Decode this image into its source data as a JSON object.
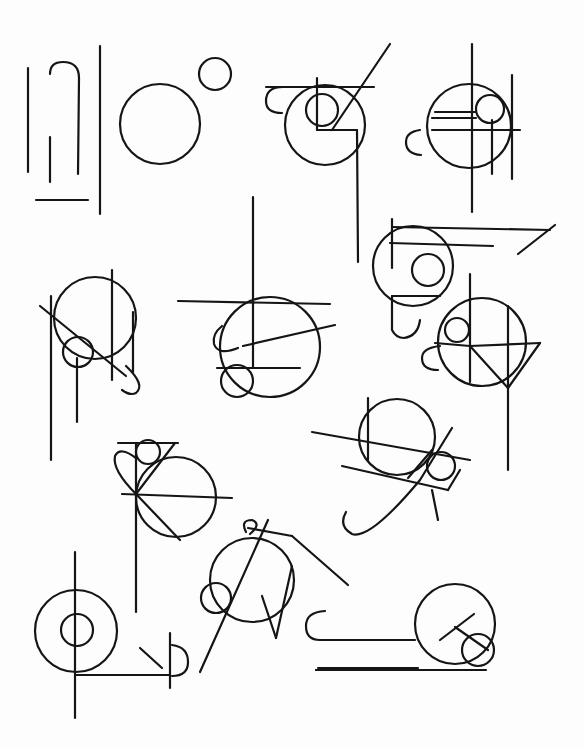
{
  "ink_color": "#151515",
  "paper_color": "#fdfdfd",
  "glyphs": [
    {
      "id": "g1",
      "lines": [
        [
          28,
          68,
          28,
          172
        ],
        [
          50,
          137,
          50,
          182
        ],
        [
          36,
          200,
          88,
          200
        ],
        [
          100,
          46,
          100,
          214
        ]
      ],
      "paths": [
        "M50,74 Q50,62 63,62 Q79,62 79,78 L78,174"
      ],
      "circles": []
    },
    {
      "id": "g2",
      "lines": [],
      "paths": [],
      "circles": [
        [
          160,
          124,
          40
        ],
        [
          215,
          74,
          16
        ]
      ]
    },
    {
      "id": "g3",
      "lines": [
        [
          266,
          87,
          374,
          87
        ],
        [
          317,
          78,
          317,
          130
        ],
        [
          317,
          130,
          357,
          130
        ],
        [
          332,
          130,
          390,
          44
        ],
        [
          357,
          130,
          358,
          262
        ]
      ],
      "paths": [
        "M283,87 Q266,87 266,101 Q266,113 282,113"
      ],
      "circles": [
        [
          325,
          125,
          40
        ],
        [
          322,
          110,
          16
        ]
      ]
    },
    {
      "id": "g4",
      "lines": [
        [
          472,
          44,
          472,
          212
        ],
        [
          432,
          118,
          476,
          118
        ],
        [
          435,
          112,
          476,
          112
        ],
        [
          432,
          130,
          520,
          130
        ],
        [
          492,
          120,
          492,
          174
        ],
        [
          512,
          75,
          512,
          179
        ]
      ],
      "paths": [
        "M420,130 Q406,132 406,142 Q406,154 421,155"
      ],
      "circles": [
        [
          469,
          126,
          42
        ],
        [
          490,
          109,
          14
        ]
      ]
    },
    {
      "id": "g5",
      "lines": [
        [
          392,
          219,
          392,
          268
        ],
        [
          392,
          227,
          550,
          230
        ],
        [
          390,
          243,
          493,
          246
        ],
        [
          392,
          296,
          440,
          296
        ],
        [
          518,
          254,
          555,
          225
        ]
      ],
      "paths": [
        "M392,296 L392,330 Q396,338 404,338 Q418,336 420,320"
      ],
      "circles": [
        [
          413,
          266,
          40
        ],
        [
          428,
          270,
          16
        ]
      ]
    },
    {
      "id": "g6",
      "lines": [
        [
          470,
          274,
          470,
          382
        ],
        [
          470,
          346,
          540,
          343
        ],
        [
          470,
          346,
          508,
          388
        ],
        [
          508,
          388,
          540,
          343
        ],
        [
          508,
          306,
          508,
          470
        ],
        [
          435,
          343,
          470,
          346
        ]
      ],
      "paths": [
        "M440,346 Q422,348 422,358 Q422,370 438,370"
      ],
      "circles": [
        [
          482,
          342,
          44
        ],
        [
          457,
          330,
          12
        ]
      ]
    },
    {
      "id": "g7",
      "lines": [
        [
          51,
          296,
          51,
          460
        ],
        [
          40,
          306,
          126,
          376
        ],
        [
          112,
          270,
          112,
          380
        ],
        [
          133,
          312,
          133,
          372
        ],
        [
          77,
          358,
          77,
          422
        ]
      ],
      "paths": [
        "M126,366 Q146,385 136,393 Q130,396 122,390"
      ],
      "circles": [
        [
          95,
          318,
          41
        ],
        [
          78,
          352,
          15
        ]
      ]
    },
    {
      "id": "g8",
      "lines": [
        [
          178,
          301,
          330,
          304
        ],
        [
          253,
          197,
          253,
          368
        ],
        [
          217,
          368,
          300,
          368
        ],
        [
          243,
          346,
          335,
          325
        ]
      ],
      "paths": [
        "M222,326 Q212,334 214,344 Q218,356 238,348"
      ],
      "circles": [
        [
          270,
          347,
          50
        ],
        [
          237,
          381,
          16
        ]
      ]
    },
    {
      "id": "g9",
      "lines": [
        [
          312,
          432,
          470,
          460
        ],
        [
          342,
          466,
          448,
          490
        ],
        [
          368,
          398,
          368,
          460
        ],
        [
          408,
          478,
          432,
          450
        ],
        [
          432,
          490,
          438,
          520
        ],
        [
          460,
          470,
          448,
          490
        ]
      ],
      "paths": [
        "M452,428 L420,480 Q370,540 352,534 Q338,526 346,512"
      ],
      "circles": [
        [
          397,
          437,
          38
        ],
        [
          441,
          466,
          14
        ]
      ]
    },
    {
      "id": "g10",
      "lines": [
        [
          118,
          443,
          178,
          443
        ],
        [
          136,
          443,
          136,
          612
        ],
        [
          122,
          494,
          232,
          498
        ],
        [
          136,
          494,
          180,
          540
        ],
        [
          136,
          494,
          175,
          443
        ]
      ],
      "paths": [
        "M136,494 Q112,470 115,456 Q120,446 136,458"
      ],
      "circles": [
        [
          176,
          497,
          40
        ],
        [
          148,
          452,
          12
        ]
      ]
    },
    {
      "id": "g11",
      "lines": [
        [
          268,
          520,
          200,
          672
        ],
        [
          248,
          528,
          292,
          536
        ],
        [
          292,
          536,
          348,
          585
        ],
        [
          262,
          596,
          276,
          638
        ],
        [
          276,
          638,
          292,
          566
        ]
      ],
      "paths": [
        "M246,532 Q240,520 252,520 Q262,524 250,534"
      ],
      "circles": [
        [
          252,
          580,
          42
        ],
        [
          216,
          598,
          15
        ]
      ]
    },
    {
      "id": "g12",
      "lines": [
        [
          75,
          552,
          75,
          718
        ],
        [
          75,
          675,
          170,
          675
        ],
        [
          170,
          633,
          170,
          688
        ],
        [
          140,
          648,
          162,
          668
        ]
      ],
      "paths": [
        "M172,645 Q188,647 188,662 Q188,676 172,676"
      ],
      "circles": [
        [
          76,
          631,
          41
        ],
        [
          77,
          630,
          16
        ]
      ]
    },
    {
      "id": "g13",
      "lines": [
        [
          318,
          668,
          418,
          668
        ],
        [
          316,
          670,
          486,
          670
        ],
        [
          316,
          670,
          485,
          670
        ],
        [
          440,
          640,
          474,
          614
        ],
        [
          455,
          627,
          488,
          650
        ]
      ],
      "paths": [
        "M325,611 Q306,612 306,626 Q306,640 320,640 L415,640"
      ],
      "circles": [
        [
          455,
          624,
          40
        ],
        [
          478,
          650,
          16
        ]
      ]
    }
  ],
  "extra_strokes": [
    [
      316,
      664,
      486,
      666
    ]
  ]
}
